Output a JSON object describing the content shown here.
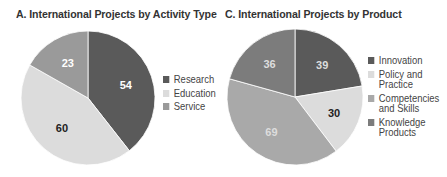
{
  "chart_data": [
    {
      "type": "pie",
      "title": "A.  International Projects by Activity Type",
      "categories": [
        "Research",
        "Education",
        "Service"
      ],
      "values": [
        54,
        60,
        23
      ],
      "colors": [
        "#5a5a5a",
        "#dcdcdc",
        "#9a9a9a"
      ],
      "label_colors": [
        "#ffffff",
        "#222222",
        "#ffffff"
      ],
      "legend_position": "right"
    },
    {
      "type": "pie",
      "title": "C.  International Projects by Product",
      "categories": [
        "Innovation",
        "Policy and\nPractice",
        "Competencies\nand Skills",
        "Knowledge\nProducts"
      ],
      "values": [
        39,
        30,
        69,
        36
      ],
      "colors": [
        "#5a5a5a",
        "#dcdcdc",
        "#a9a9a9",
        "#7c7c7c"
      ],
      "label_colors": [
        "#dddddd",
        "#222222",
        "#dddddd",
        "#dddddd"
      ],
      "legend_position": "right"
    }
  ]
}
